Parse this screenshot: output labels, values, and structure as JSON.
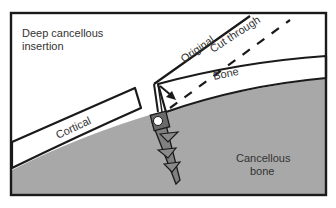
{
  "labels": {
    "title_line1": "Deep cancellous",
    "title_line2": "insertion",
    "original": "Original",
    "cut_through": "Cut through",
    "bone": "Bone",
    "cortical": "Cortical",
    "cancellous_line1": "Cancellous",
    "cancellous_line2": "bone"
  },
  "colors": {
    "background": "#ffffff",
    "frame": "#1a1a1a",
    "cancellous_fill": "#a8a8a8",
    "cortical_fill": "#ffffff",
    "screw_fill": "#808080",
    "screw_head": "#6a6a6a",
    "text": "#333333"
  }
}
